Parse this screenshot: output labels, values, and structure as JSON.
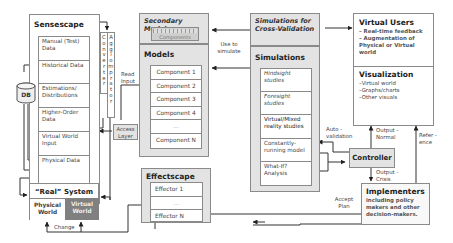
{
  "sensescape": {
    "title": "Sensescape",
    "items": [
      "Manual (Test) Data",
      "Historical Data",
      "Estimations/ Distributions",
      "Higher-Order Data",
      "Virtual World Input",
      "Physical Data"
    ],
    "db_label": "DB",
    "converter": "Converter",
    "agglomerator": "Agglomerator",
    "access_layer": "Access Layer"
  },
  "real_system": {
    "title": "“Real” System",
    "physical": "Physical World",
    "virtual": "Virtual World",
    "change_label": "Change"
  },
  "secondary_models": {
    "title": "Secondary Models",
    "components_label": "Components"
  },
  "models": {
    "title": "Models",
    "components": [
      "Component 1",
      "Component 2",
      "Component 3",
      "Component 4",
      "...",
      "Component N"
    ]
  },
  "effectscape": {
    "title": "Effectscape",
    "items": [
      "Effector 1",
      "...",
      "Effector N"
    ]
  },
  "cross_validation": {
    "title": "Simulations for Cross-Validation"
  },
  "simulations": {
    "title": "Simulations",
    "items": [
      "Hindsight studies",
      "Foresight studies",
      "Virtual/Mixed reality studies",
      "Constantly-running model",
      "What-If? Analysis"
    ]
  },
  "virtual_users": {
    "title": "Virtual Users",
    "bullets": [
      "– Real-time feedback",
      "– Augmentation of Physical or Virtual world"
    ]
  },
  "visualization": {
    "title": "Visualization",
    "bullets": [
      "–Virtual world",
      "–Graphs/charts",
      "–Other visuals"
    ]
  },
  "controller": {
    "title": "Controller"
  },
  "implementers": {
    "title": "Implementers",
    "text": "including policy makers and other decision-makers."
  },
  "edge_labels": {
    "read_input": "Read Input",
    "use_to_simulate": "Use to simulate",
    "auto_validation": "Auto - validation",
    "output_normal": "Output - Normal",
    "output_crisis": "Output - Crisis",
    "reference": "Refer - ence",
    "accept_plan": "Accept Plan"
  }
}
